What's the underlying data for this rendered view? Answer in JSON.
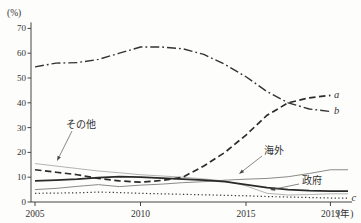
{
  "chart_data": {
    "type": "line",
    "title": "",
    "unit_y": "(%)",
    "unit_x": "(年)",
    "grid": false,
    "legend_position": "none",
    "axes": {
      "ylim": [
        0,
        70
      ],
      "y_ticks": [
        0,
        10,
        20,
        30,
        40,
        50,
        60,
        70
      ],
      "x_ticks": [
        {
          "year": 2005,
          "label": "2005"
        },
        {
          "year": 2010,
          "label": "2010"
        },
        {
          "year": 2015,
          "label": "2015"
        },
        {
          "year": 2019,
          "label": "2019"
        }
      ]
    },
    "x": [
      2005,
      2006,
      2007,
      2008,
      2009,
      2010,
      2011,
      2012,
      2013,
      2014,
      2015,
      2016,
      2017,
      2018,
      2019
    ],
    "series": [
      {
        "id": "other",
        "label": "その他",
        "end_label": "",
        "color": "#aaaaaa",
        "width": 0.9,
        "dash": "",
        "extend_to_edge": true,
        "values": [
          15.5,
          14.5,
          13.5,
          12.5,
          11.8,
          11,
          10.5,
          10,
          9.3,
          8.5,
          6.5,
          3.5,
          2.8,
          3,
          3.3
        ]
      },
      {
        "id": "overseas",
        "label": "海外",
        "end_label": "",
        "color": "#8a8a8a",
        "width": 1,
        "dash": "",
        "extend_to_edge": true,
        "values": [
          5,
          5.5,
          6.3,
          7,
          6.2,
          6.8,
          7.2,
          7.8,
          8.2,
          8.8,
          9.2,
          9.5,
          10.2,
          11.5,
          13
        ]
      },
      {
        "id": "line-c",
        "label": "",
        "end_label": "c",
        "color": "#3a3a3a",
        "width": 1.2,
        "dash": "1.3 2.4",
        "extend_to_edge": true,
        "values": [
          3.5,
          3.6,
          3.7,
          4,
          3.8,
          3.5,
          3.3,
          3.1,
          2.9,
          2.7,
          2.5,
          2.2,
          2,
          1.8,
          1.6
        ]
      },
      {
        "id": "government",
        "label": "政府",
        "end_label": "",
        "color": "#2a2a2a",
        "width": 1.8,
        "dash": "",
        "extend_to_edge": true,
        "values": [
          8.5,
          8.8,
          9.2,
          9.8,
          10.2,
          10,
          9.6,
          9.2,
          8.8,
          8.2,
          7,
          5.8,
          5,
          4.6,
          4.4
        ]
      },
      {
        "id": "line-b",
        "label": "",
        "end_label": "b",
        "color": "#333333",
        "width": 1.4,
        "dash": "9 3 1.8 3",
        "extend_to_edge": false,
        "values": [
          54.5,
          56,
          56.2,
          57.5,
          60,
          62.5,
          62.5,
          61.8,
          59.5,
          55.5,
          50.5,
          44.5,
          40,
          37.5,
          36.5
        ]
      },
      {
        "id": "line-a",
        "label": "",
        "end_label": "a",
        "color": "#2b2b2b",
        "width": 1.7,
        "dash": "6.5 3.5",
        "extend_to_edge": false,
        "values": [
          13,
          12,
          11,
          9.5,
          8.5,
          8,
          8.7,
          10,
          14.5,
          20,
          27,
          35,
          40,
          42,
          43
        ]
      }
    ],
    "annotations": [
      {
        "id": "sonota",
        "label": "その他",
        "tx": 81,
        "ty": 124,
        "from": [
          72,
          131
        ],
        "to": [
          57,
          161
        ]
      },
      {
        "id": "kaigai",
        "label": "海外",
        "tx": 274,
        "ty": 150,
        "from": [
          262,
          156
        ],
        "to": [
          239,
          174
        ]
      },
      {
        "id": "seifu",
        "label": "政府",
        "tx": 312,
        "ty": 180,
        "from": [
          299,
          184
        ],
        "to": [
          270,
          190
        ]
      }
    ]
  }
}
